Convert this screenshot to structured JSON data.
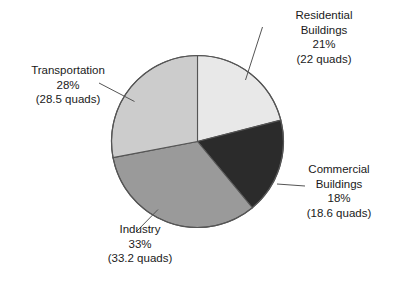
{
  "chart_data": {
    "type": "pie",
    "title": "",
    "subtitle": "",
    "xlabel": "",
    "ylabel": "",
    "legend_position": "callouts",
    "grid": false,
    "units": "quads",
    "start_angle_deg": 0,
    "direction": "clockwise",
    "categories": [
      "Residential Buildings",
      "Commercial Buildings",
      "Industry",
      "Transportation"
    ],
    "values": [
      21,
      18,
      33,
      28
    ],
    "value_unit": "percent",
    "absolute_values": [
      22,
      18.6,
      33.2,
      28.5
    ],
    "slices": [
      {
        "name": "residential-buildings",
        "label_line1": "Residential",
        "label_line2": "Buildings",
        "percent_text": "21%",
        "quads_text": "(22 quads)",
        "percent": 21,
        "quads": 22,
        "color": "#e8e8e8"
      },
      {
        "name": "commercial-buildings",
        "label_line1": "Commercial",
        "label_line2": "Buildings",
        "percent_text": "18%",
        "quads_text": "(18.6 quads)",
        "percent": 18,
        "quads": 18.6,
        "color": "#2b2b2b"
      },
      {
        "name": "industry",
        "label_line1": "Industry",
        "label_line2": "",
        "percent_text": "33%",
        "quads_text": "(33.2 quads)",
        "percent": 33,
        "quads": 33.2,
        "color": "#9a9a9a"
      },
      {
        "name": "transportation",
        "label_line1": "Transportation",
        "label_line2": "",
        "percent_text": "28%",
        "quads_text": "(28.5 quads)",
        "percent": 28,
        "quads": 28.5,
        "color": "#cccccc"
      }
    ],
    "colors": {
      "residential": "#e8e8e8",
      "commercial": "#2b2b2b",
      "industry": "#9a9a9a",
      "transportation": "#cccccc",
      "outline": "#555555",
      "background": "#ffffff",
      "text": "#1a1a1a"
    }
  }
}
